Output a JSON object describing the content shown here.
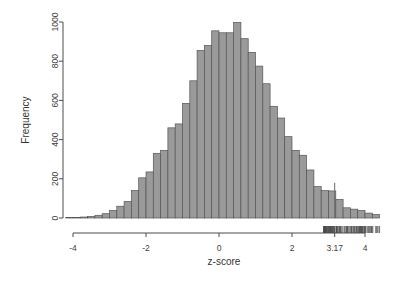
{
  "figure": {
    "kind": "r-histogram-with-rug",
    "background_color": "#ffffff",
    "bar_fill_color": "#9a9a9a",
    "bar_border_color": "#555555",
    "axis_color": "#4d4d4d",
    "rug_color": "#4d4d4d",
    "marker_line_color": "#6b6b6b"
  },
  "chart_data": {
    "type": "bar",
    "subtype": "histogram",
    "title": "",
    "subtitle": "",
    "xlabel": "z-score",
    "ylabel": "Frequency",
    "xlim": [
      -4.35,
      4.5
    ],
    "ylim": [
      0,
      1030
    ],
    "grid": false,
    "legend": null,
    "bin_width": 0.2,
    "x_ticks": [
      -4,
      -2,
      0,
      2,
      3.17,
      4
    ],
    "x_tick_labels": [
      "-4",
      "-2",
      "0",
      "2",
      "3.17",
      "4"
    ],
    "y_ticks": [
      0,
      200,
      400,
      600,
      800,
      1000
    ],
    "y_tick_labels": [
      "0",
      "200",
      "400",
      "600",
      "800",
      "1000"
    ],
    "annotations": [
      {
        "name": "threshold-line",
        "type": "vertical-line",
        "x": 3.17,
        "y_top": 180,
        "label": "3.17"
      },
      {
        "name": "rug-plot",
        "type": "rug",
        "description": "dense tick marks along x axis from about 2.9 to 4.4"
      }
    ],
    "bin_centers": [
      -4.1,
      -3.9,
      -3.7,
      -3.5,
      -3.3,
      -3.1,
      -2.9,
      -2.7,
      -2.5,
      -2.3,
      -2.1,
      -1.9,
      -1.7,
      -1.5,
      -1.3,
      -1.1,
      -0.9,
      -0.7,
      -0.5,
      -0.3,
      -0.1,
      0.1,
      0.3,
      0.5,
      0.7,
      0.9,
      1.1,
      1.3,
      1.5,
      1.7,
      1.9,
      2.1,
      2.3,
      2.5,
      2.7,
      2.9,
      3.1,
      3.3,
      3.5,
      3.7,
      3.9,
      4.1,
      4.3
    ],
    "values": [
      2,
      3,
      5,
      8,
      14,
      22,
      38,
      60,
      84,
      140,
      205,
      235,
      330,
      345,
      460,
      480,
      585,
      700,
      855,
      880,
      955,
      945,
      945,
      998,
      915,
      845,
      775,
      685,
      570,
      510,
      415,
      345,
      320,
      245,
      160,
      140,
      138,
      95,
      52,
      45,
      38,
      25,
      18
    ]
  }
}
